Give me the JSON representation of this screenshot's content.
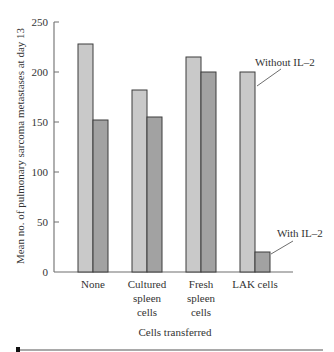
{
  "chart_data": {
    "type": "bar",
    "title": "",
    "xlabel": "Cells transferred",
    "ylabel": "Mean no. of pulmonary sarcoma metastases at day 13",
    "ylim": [
      0,
      250
    ],
    "yticks": [
      0,
      50,
      100,
      150,
      200,
      250
    ],
    "grid": false,
    "categories": [
      "None",
      "Cultured spleen cells",
      "Fresh spleen cells",
      "LAK cells"
    ],
    "category_lines": [
      [
        "None"
      ],
      [
        "Cultured",
        "spleen",
        "cells"
      ],
      [
        "Fresh",
        "spleen",
        "cells"
      ],
      [
        "LAK cells"
      ]
    ],
    "series": [
      {
        "name": "Without IL-2",
        "values": [
          228,
          182,
          215,
          200
        ],
        "color": "#c9c9c9"
      },
      {
        "name": "With IL-2",
        "values": [
          152,
          155,
          200,
          20
        ],
        "color": "#a2a2a2"
      }
    ],
    "annotations": [
      {
        "text": "Without IL–2",
        "target_series": 0,
        "target_category": 3
      },
      {
        "text": "With IL–2",
        "target_series": 1,
        "target_category": 3
      }
    ],
    "legend_position": "inline annotations"
  },
  "colors": {
    "bar_outline": "#3c3c3c",
    "axis": "#6e6e6e",
    "text": "#333333"
  }
}
